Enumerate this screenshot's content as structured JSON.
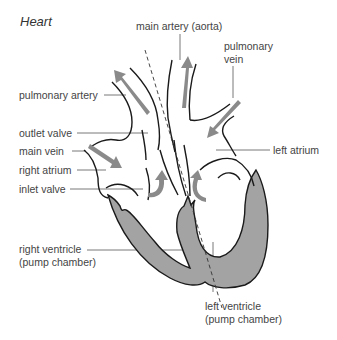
{
  "title": "Heart",
  "labels": {
    "main_artery": "main artery (aorta)",
    "pulmonary_vein_1": "pulmonary",
    "pulmonary_vein_2": "vein",
    "pulmonary_artery": "pulmonary artery",
    "outlet_valve": "outlet valve",
    "main_vein": "main vein",
    "right_atrium": "right atrium",
    "inlet_valve": "inlet valve",
    "left_atrium": "left atrium",
    "right_ventricle_1": "right ventricle",
    "right_ventricle_2": "(pump chamber)",
    "left_ventricle_1": "left ventricle",
    "left_ventricle_2": "(pump chamber)"
  },
  "colors": {
    "outline": "#1a1a1a",
    "muscle": "#a0a0a0",
    "arrow": "#8a8a8a",
    "leader": "#555555",
    "text": "#444444"
  }
}
